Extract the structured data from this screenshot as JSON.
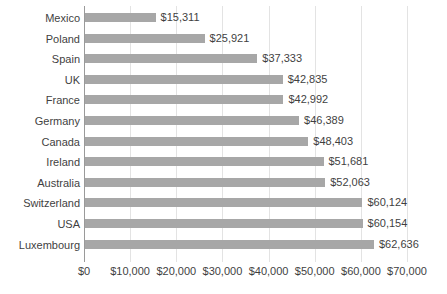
{
  "chart_data": {
    "type": "bar",
    "orientation": "horizontal",
    "title": "",
    "subtitle": "",
    "xlabel": "",
    "ylabel": "",
    "categories": [
      "Mexico",
      "Poland",
      "Spain",
      "UK",
      "France",
      "Germany",
      "Canada",
      "Ireland",
      "Australia",
      "Switzerland",
      "USA",
      "Luxembourg"
    ],
    "values": [
      15311,
      25921,
      37333,
      42835,
      42992,
      46389,
      48403,
      51681,
      52063,
      60124,
      60154,
      62636
    ],
    "value_labels": [
      "$15,311",
      "$25,921",
      "$37,333",
      "$42,835",
      "$42,992",
      "$46,389",
      "$48,403",
      "$51,681",
      "$52,063",
      "$60,124",
      "$60,154",
      "$62,636"
    ],
    "xlim": [
      0,
      70000
    ],
    "xtick_values": [
      0,
      10000,
      20000,
      30000,
      40000,
      50000,
      60000,
      70000
    ],
    "xtick_labels": [
      "$0",
      "$10,000",
      "$20,000",
      "$30,000",
      "$40,000",
      "$50,000",
      "$60,000",
      "$70,000"
    ],
    "grid": "vertical",
    "legend": false,
    "bar_color": "#a7a7a7",
    "gridline_color": "#e3e3e3",
    "axis_color": "#9a9a9a",
    "text_color": "#3f3f3f"
  }
}
